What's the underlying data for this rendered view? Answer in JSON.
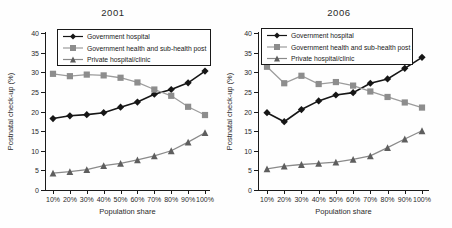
{
  "figure": {
    "bg_color": "#fefefe",
    "axis_color": "#1a1a1a",
    "text_color": "#2a2a2a"
  },
  "chart_data": [
    {
      "type": "line",
      "title": "2001",
      "xlabel": "Population share",
      "ylabel": "Postnatal check-up (%)",
      "ylim": [
        0,
        40
      ],
      "ytick_step": 5,
      "grid": false,
      "legend_position": "top-inside-boxed",
      "categories": [
        "10%",
        "20%",
        "30%",
        "40%",
        "50%",
        "60%",
        "70%",
        "80%",
        "90%",
        "100%"
      ],
      "series": [
        {
          "name": "Government hospital",
          "marker": "diamond",
          "color": "#161616",
          "line_color": "#161616",
          "values": [
            18.2,
            18.9,
            19.2,
            19.7,
            21.1,
            22.4,
            24.4,
            25.6,
            27.3,
            30.3
          ]
        },
        {
          "name": "Government health and sub-health post",
          "marker": "square",
          "color": "#8d8d8d",
          "line_color": "#9c9c9c",
          "values": [
            29.6,
            29.0,
            29.4,
            29.2,
            28.6,
            27.4,
            25.6,
            24.0,
            21.2,
            19.1
          ]
        },
        {
          "name": "Private hospital/clinic",
          "marker": "triangle",
          "color": "#5e5e5e",
          "line_color": "#8a8a8a",
          "values": [
            4.3,
            4.7,
            5.2,
            6.2,
            6.8,
            7.7,
            8.7,
            10.0,
            12.2,
            14.6
          ]
        }
      ]
    },
    {
      "type": "line",
      "title": "2006",
      "xlabel": "Population share",
      "ylabel": "Postnatal check-up (%)",
      "ylim": [
        0,
        40
      ],
      "ytick_step": 5,
      "grid": false,
      "legend_position": "top-inside-boxed",
      "categories": [
        "10%",
        "20%",
        "30%",
        "40%",
        "50%",
        "60%",
        "70%",
        "80%",
        "90%",
        "100%"
      ],
      "series": [
        {
          "name": "Government hospital",
          "marker": "diamond",
          "color": "#161616",
          "line_color": "#161616",
          "values": [
            19.7,
            17.4,
            20.5,
            22.7,
            24.2,
            24.8,
            27.2,
            28.3,
            31.0,
            33.8
          ]
        },
        {
          "name": "Government health and sub-health post",
          "marker": "square",
          "color": "#8d8d8d",
          "line_color": "#9c9c9c",
          "values": [
            31.4,
            27.2,
            29.1,
            27.0,
            27.5,
            26.6,
            25.1,
            23.7,
            22.3,
            21.0
          ]
        },
        {
          "name": "Private hospital/clinic",
          "marker": "triangle",
          "color": "#5e5e5e",
          "line_color": "#8a8a8a",
          "values": [
            5.4,
            6.1,
            6.5,
            6.8,
            7.1,
            7.8,
            8.7,
            10.8,
            13.0,
            15.1
          ]
        }
      ]
    }
  ]
}
